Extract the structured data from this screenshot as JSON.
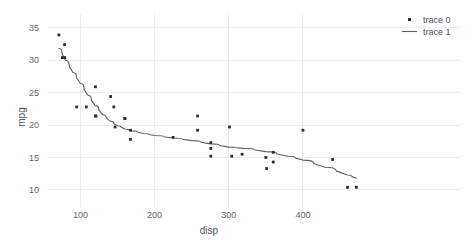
{
  "chart_data": {
    "type": "scatter",
    "title": "",
    "xlabel": "disp",
    "ylabel": "mpg",
    "xlim": [
      55,
      485
    ],
    "ylim": [
      8.6,
      36.2
    ],
    "xticks": [
      100,
      200,
      300,
      400
    ],
    "yticks": [
      10,
      15,
      20,
      25,
      30,
      35
    ],
    "grid": true,
    "legend_position": "top-right",
    "background": "#ffffff",
    "gridcolor": "#eaeef2",
    "marker_color": "#2a2f36",
    "line_color": "#5a6068",
    "series": [
      {
        "name": "trace 0",
        "mode": "markers",
        "x": [
          71.1,
          75.7,
          78.7,
          79.0,
          95.1,
          108.0,
          120.1,
          120.3,
          121.0,
          140.8,
          145.0,
          146.7,
          160.0,
          160.0,
          167.6,
          167.6,
          225.0,
          258.0,
          258.0,
          275.8,
          275.8,
          275.8,
          301.0,
          304.0,
          318.0,
          350.0,
          351.0,
          360.0,
          360.0,
          400.0,
          440.0,
          460.0,
          472.0
        ],
        "y": [
          33.9,
          30.4,
          32.4,
          30.4,
          22.8,
          22.8,
          21.4,
          25.9,
          21.4,
          24.4,
          22.8,
          19.7,
          21.0,
          21.0,
          19.2,
          17.8,
          18.1,
          21.4,
          19.2,
          17.3,
          16.4,
          15.2,
          19.7,
          15.2,
          15.5,
          15.0,
          13.3,
          14.3,
          15.8,
          19.2,
          14.7,
          10.4,
          10.4
        ]
      },
      {
        "name": "trace 1",
        "mode": "lines",
        "x": [
          71,
          80,
          90,
          100,
          110,
          120,
          130,
          140,
          150,
          160,
          170,
          185,
          200,
          225,
          250,
          275,
          300,
          320,
          350,
          380,
          400,
          430,
          460,
          472
        ],
        "y": [
          31.8,
          30.0,
          28.1,
          26.4,
          24.6,
          23.0,
          21.6,
          20.6,
          19.9,
          19.4,
          19.1,
          18.7,
          18.4,
          18.0,
          17.6,
          17.1,
          16.6,
          16.4,
          15.9,
          15.2,
          14.6,
          13.5,
          12.3,
          11.8
        ]
      }
    ],
    "legend": [
      {
        "label": "trace 0",
        "type": "marker",
        "color": "#2a2f36"
      },
      {
        "label": "trace 1",
        "type": "line",
        "color": "#5a6068"
      }
    ]
  }
}
